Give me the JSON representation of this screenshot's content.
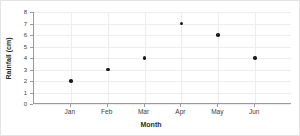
{
  "chart_data": {
    "type": "scatter",
    "title": "",
    "xlabel": "Month",
    "ylabel": "Rainfall (cm)",
    "categories": [
      "Jan",
      "Feb",
      "Mar",
      "Apr",
      "May",
      "Jun"
    ],
    "values": [
      2,
      3,
      4,
      7,
      6,
      4
    ],
    "series": [
      {
        "name": "Rainfall",
        "values": [
          2,
          3,
          4,
          7,
          6,
          4
        ],
        "marker_color": "#1a1a1a"
      }
    ],
    "points": [
      {
        "x": "Jan",
        "y": 2
      },
      {
        "x": "Feb",
        "y": 3
      },
      {
        "x": "Mar",
        "y": 4
      },
      {
        "x": "Apr",
        "y": 7
      },
      {
        "x": "May",
        "y": 6
      },
      {
        "x": "Jun",
        "y": 4
      }
    ],
    "ylim": [
      0,
      8
    ],
    "yticks": [
      0,
      1,
      2,
      3,
      4,
      5,
      6,
      7,
      8
    ],
    "ytick_labels": [
      "0",
      "1",
      "2",
      "3",
      "4",
      "5",
      "6",
      "7",
      "8"
    ],
    "xtick_labels": [
      "Jan",
      "Feb",
      "Mar",
      "Apr",
      "May",
      "Jun"
    ],
    "grid": true,
    "grid_color": "#ededed",
    "axis_color": "#9a9a9a",
    "background": "#ffffff",
    "legend": false,
    "legend_position": "none"
  }
}
